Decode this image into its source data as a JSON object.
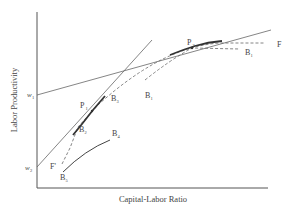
{
  "diagram": {
    "type": "economics-productivity-diagram",
    "x_axis_label": "Capital-Labor Ratio",
    "y_axis_label": "Labor Productivity",
    "y_ticks": [
      {
        "label": "w",
        "sub": "1"
      },
      {
        "label": "w",
        "sub": "2"
      }
    ],
    "points": {
      "P1": {
        "label": "P",
        "sub": "1"
      },
      "P2": {
        "label": "P",
        "sub": "2"
      }
    },
    "curve_labels": {
      "F": {
        "label": "F",
        "sub": ""
      },
      "F_prime": {
        "label": "F'",
        "sub": ""
      },
      "B1_start": {
        "label": "B",
        "sub": "1"
      },
      "B1_end": {
        "label": "B",
        "sub": "1"
      },
      "B2": {
        "label": "B",
        "sub": "2"
      },
      "B3": {
        "label": "B",
        "sub": "3"
      },
      "B4": {
        "label": "B",
        "sub": "4"
      },
      "B5": {
        "label": "B",
        "sub": "5"
      }
    },
    "colors": {
      "line": "#555555",
      "text": "#444444",
      "background": "#ffffff"
    }
  }
}
